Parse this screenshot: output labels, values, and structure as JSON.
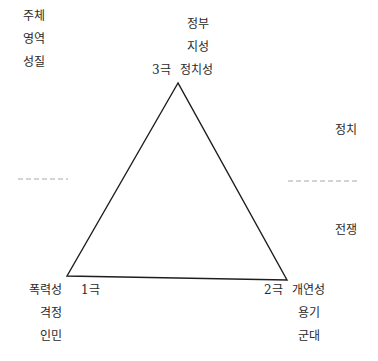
{
  "legend_column": {
    "items": [
      "주체",
      "영역",
      "성질"
    ]
  },
  "poles": {
    "top": {
      "pole_label": "3극",
      "lines": [
        "정부",
        "지성",
        "정치성"
      ]
    },
    "bottom_left": {
      "pole_label": "1극",
      "lines": [
        "폭력성",
        "격정",
        "인민"
      ]
    },
    "bottom_right": {
      "pole_label": "2극",
      "lines": [
        "개연성",
        "용기",
        "군대"
      ]
    }
  },
  "zones": {
    "upper": "정치",
    "lower": "전쟁"
  },
  "colors": {
    "line": "#1e1e1e",
    "dashed": "#a8a8a8",
    "text": "#2a2a2a"
  }
}
